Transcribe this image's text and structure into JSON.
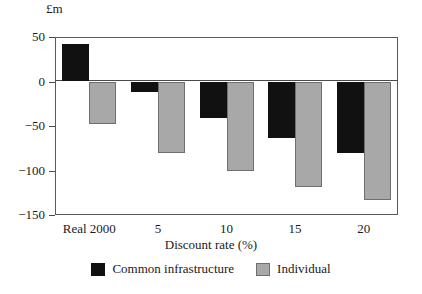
{
  "chart_data": {
    "type": "bar",
    "title": "",
    "subtitle": "",
    "xlabel": "Discount rate (%)",
    "ylabel": "£m",
    "categories": [
      "Real 2000",
      "5",
      "10",
      "15",
      "20"
    ],
    "series": [
      {
        "name": "Common infrastructure",
        "color": "#111111",
        "values": [
          42,
          -12,
          -41,
          -63,
          -80
        ]
      },
      {
        "name": "Individual",
        "color": "#a8a8a8",
        "values": [
          -48,
          -80,
          -100,
          -118,
          -133
        ]
      }
    ],
    "ylim": [
      -150,
      50
    ],
    "yticks": [
      50,
      0,
      -50,
      -100,
      -150
    ],
    "ytick_labels": [
      "50",
      "0",
      "−50",
      "−100",
      "−150"
    ],
    "grid": false,
    "legend_position": "bottom",
    "zero_line": true
  },
  "legend": {
    "items": [
      {
        "label": "Common infrastructure",
        "swatch": "black-swatch-icon"
      },
      {
        "label": "Individual",
        "swatch": "gray-swatch-icon"
      }
    ]
  }
}
